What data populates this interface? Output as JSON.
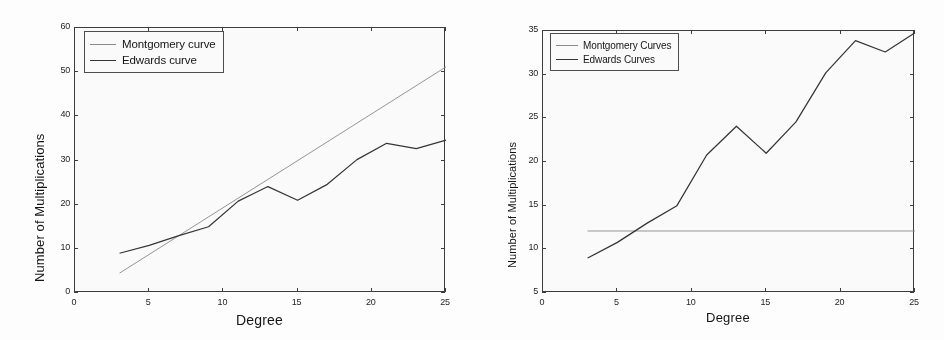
{
  "figure": {
    "panel_count": 2,
    "background": "#fdfdfd",
    "axis_color": "#3a3a3a",
    "montgomery_color": "#8a8a8a",
    "edwards_color": "#333333"
  },
  "left": {
    "axis_title_x": "Degree",
    "axis_title_y": "Number of Multiplications",
    "legend": [
      {
        "label": "Montgomery curve",
        "series": "montgomery"
      },
      {
        "label": "Edwards curve",
        "series": "edwards"
      }
    ],
    "xticks": [
      "0",
      "5",
      "10",
      "15",
      "20",
      "25"
    ],
    "yticks": [
      "0",
      "10",
      "20",
      "30",
      "40",
      "50",
      "60"
    ]
  },
  "right": {
    "axis_title_x": "Degree",
    "axis_title_y": "Number of Multiplications",
    "legend": [
      {
        "label": "Montgomery Curves",
        "series": "montgomery"
      },
      {
        "label": "Edwards Curves",
        "series": "edwards"
      }
    ],
    "xticks": [
      "0",
      "5",
      "10",
      "15",
      "20",
      "25"
    ],
    "yticks": [
      "5",
      "10",
      "15",
      "20",
      "25",
      "30",
      "35"
    ]
  },
  "chart_data": [
    {
      "type": "line",
      "panel": "left",
      "title": "",
      "xlabel": "Degree",
      "ylabel": "Number of Multiplications",
      "xlim": [
        0,
        25
      ],
      "ylim": [
        0,
        60
      ],
      "xticks": [
        0,
        5,
        10,
        15,
        20,
        25
      ],
      "yticks": [
        0,
        10,
        20,
        30,
        40,
        50,
        60
      ],
      "grid": false,
      "legend_position": "upper-left",
      "series": [
        {
          "name": "Montgomery curve",
          "color": "#8a8a8a",
          "x": [
            3,
            25
          ],
          "values": [
            4.5,
            51.2
          ]
        },
        {
          "name": "Edwards curve",
          "color": "#333333",
          "x": [
            3,
            5,
            7,
            9,
            11,
            13,
            15,
            17,
            19,
            21,
            23,
            25
          ],
          "values": [
            9.0,
            10.8,
            13.0,
            15.0,
            20.8,
            24.1,
            21.0,
            24.6,
            30.2,
            33.9,
            32.7,
            34.6
          ]
        }
      ]
    },
    {
      "type": "line",
      "panel": "right",
      "title": "",
      "xlabel": "Degree",
      "ylabel": "Number of Multiplications",
      "xlim": [
        0,
        25
      ],
      "ylim": [
        5,
        35
      ],
      "xticks": [
        0,
        5,
        10,
        15,
        20,
        25
      ],
      "yticks": [
        5,
        10,
        15,
        20,
        25,
        30,
        35
      ],
      "grid": false,
      "legend_position": "upper-left",
      "series": [
        {
          "name": "Montgomery Curves",
          "color": "#8a8a8a",
          "x": [
            3,
            25
          ],
          "values": [
            12.1,
            12.1
          ]
        },
        {
          "name": "Edwards Curves",
          "color": "#333333",
          "x": [
            3,
            5,
            7,
            9,
            11,
            13,
            15,
            17,
            19,
            21,
            23,
            25
          ],
          "values": [
            9.0,
            10.8,
            13.0,
            15.0,
            20.8,
            24.1,
            21.0,
            24.6,
            30.2,
            33.9,
            32.6,
            34.8
          ]
        }
      ]
    }
  ]
}
